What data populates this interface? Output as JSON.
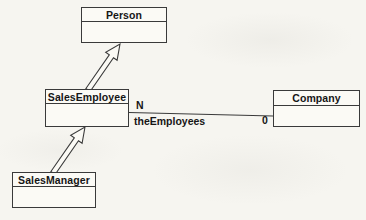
{
  "diagram": {
    "type": "uml-class-diagram",
    "background_color": "#f6f5f0",
    "line_color": "#3a3a3a",
    "text_color": "#161616",
    "box_fill_color": "#fbfaf5",
    "classes": [
      {
        "name": "Person"
      },
      {
        "name": "SalesEmployee"
      },
      {
        "name": "Company"
      },
      {
        "name": "SalesManager"
      }
    ],
    "association": {
      "from": "SalesEmployee",
      "to": "Company",
      "label": "theEmployees",
      "multiplicity_near_salesemployee": "N",
      "multiplicity_near_company": "0"
    },
    "generalizations": [
      {
        "from": "SalesEmployee",
        "to": "Person"
      },
      {
        "from": "SalesManager",
        "to": "SalesEmployee"
      }
    ]
  }
}
